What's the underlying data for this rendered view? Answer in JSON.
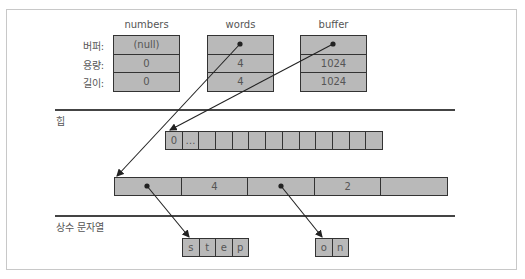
{
  "row_labels": [
    "버퍼:",
    "용량:",
    "길이:"
  ],
  "structs": [
    {
      "name": "numbers",
      "buffer": "(null)",
      "capacity": "0",
      "length": "0"
    },
    {
      "name": "words",
      "buffer": "",
      "capacity": "4",
      "length": "4"
    },
    {
      "name": "buffer",
      "buffer": "",
      "capacity": "1024",
      "length": "1024"
    }
  ],
  "sections": {
    "heap": "힙",
    "constant_strings": "상수 문자열"
  },
  "heap_byte_array": [
    "0",
    "…",
    "",
    "",
    "",
    "",
    "",
    "",
    "",
    "",
    "",
    "",
    ""
  ],
  "heap_slice_array": [
    "",
    "4",
    "",
    "2",
    ""
  ],
  "const_strings": [
    {
      "chars": [
        "s",
        "t",
        "e",
        "p"
      ]
    },
    {
      "chars": [
        "o",
        "n"
      ]
    }
  ]
}
